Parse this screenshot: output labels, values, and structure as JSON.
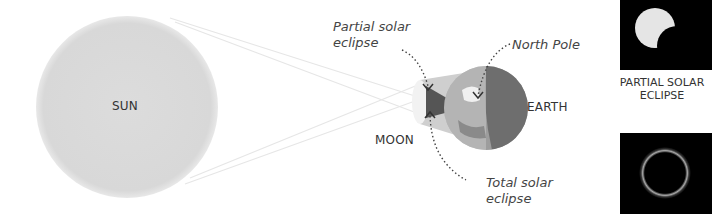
{
  "diagram": {
    "bodies": {
      "sun": "SUN",
      "moon": "MOON",
      "earth": "EARTH"
    },
    "annotations": {
      "partial_line1": "Partial solar",
      "partial_line2": "eclipse",
      "north_pole": "North Pole",
      "total_line1": "Total solar",
      "total_line2": "eclipse"
    },
    "panels": [
      {
        "caption_line1": "PARTIAL SOLAR",
        "caption_line2": "ECLIPSE",
        "type": "partial"
      },
      {
        "caption_line1": "",
        "caption_line2": "",
        "type": "total"
      }
    ],
    "colors": {
      "sun": "#d9d9d9",
      "earth_land": "#9a9a9a",
      "earth_night": "#6e6e6e",
      "panel_bg": "#000000",
      "text": "#333333"
    }
  }
}
